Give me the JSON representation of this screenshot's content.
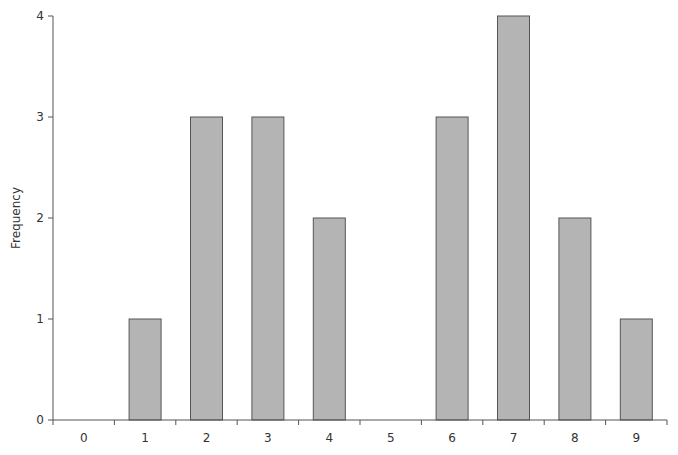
{
  "chart_data": {
    "type": "bar",
    "title": "",
    "xlabel": "",
    "ylabel": "Frequency",
    "categories": [
      "0",
      "1",
      "2",
      "3",
      "4",
      "5",
      "6",
      "7",
      "8",
      "9"
    ],
    "values": [
      0,
      1,
      3,
      3,
      2,
      0,
      3,
      4,
      2,
      1
    ],
    "ylim": [
      0,
      4
    ],
    "yticks": [
      0,
      1,
      2,
      3,
      4
    ],
    "grid": false,
    "legend": null,
    "colors": {
      "bar_fill": "#b4b4b4",
      "bar_stroke": "#555555",
      "axis": "#555555"
    }
  }
}
